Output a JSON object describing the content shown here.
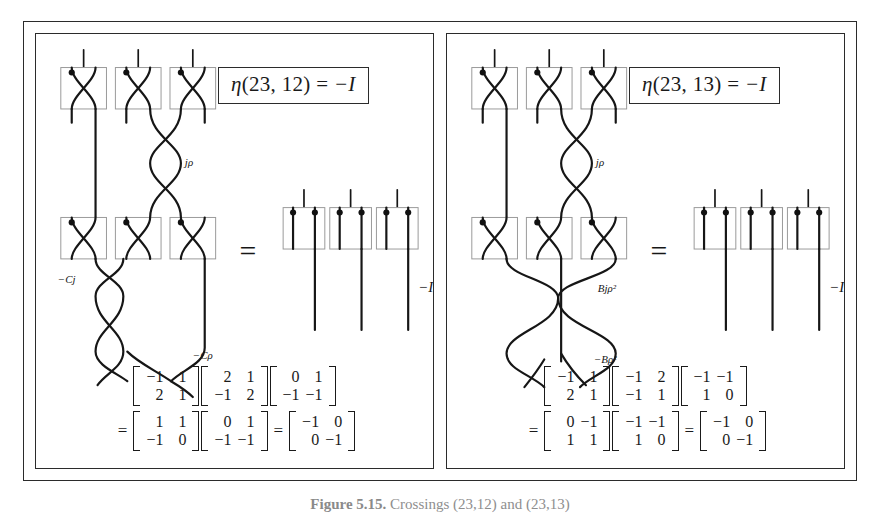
{
  "figure": {
    "caption_label": "Figure 5.15.",
    "caption_text": "Crossings (23,12) and (23,13)"
  },
  "panels": [
    {
      "id": "left",
      "equation_eta": "η(23, 12) = −I",
      "eta_symbol": "η",
      "eta_args": "(23, 12)",
      "eta_equals": "=",
      "eta_value": "−I",
      "identity_label": "−I",
      "equals_sign": "=",
      "crossing_labels": [
        "jρ",
        "−Cj",
        "−Cρ"
      ],
      "generator_boxes_top": 3,
      "generator_boxes_bottom": 3,
      "identity_boxes": 3,
      "matrix_line_1": [
        {
          "rows": [
            [
              "−1",
              "1"
            ],
            [
              "2",
              "1"
            ]
          ]
        },
        {
          "rows": [
            [
              "2",
              "1"
            ],
            [
              "−1",
              "2"
            ]
          ]
        },
        {
          "rows": [
            [
              "0",
              "1"
            ],
            [
              "−1",
              "−1"
            ]
          ]
        }
      ],
      "matrix_line_2_prefix": "=",
      "matrix_line_2": [
        {
          "rows": [
            [
              "1",
              "1"
            ],
            [
              "−1",
              "0"
            ]
          ]
        },
        {
          "rows": [
            [
              "0",
              "1"
            ],
            [
              "−1",
              "−1"
            ]
          ]
        }
      ],
      "matrix_line_2_equals": "=",
      "matrix_result": {
        "rows": [
          [
            "−1",
            "0"
          ],
          [
            "0",
            "−1"
          ]
        ]
      }
    },
    {
      "id": "right",
      "equation_eta": "η(23, 13) = −I",
      "eta_symbol": "η",
      "eta_args": "(23, 13)",
      "eta_equals": "=",
      "eta_value": "−I",
      "identity_label": "−I",
      "equals_sign": "=",
      "crossing_labels": [
        "jρ",
        "Bjρ²",
        "−Bρ²"
      ],
      "generator_boxes_top": 3,
      "generator_boxes_bottom": 3,
      "identity_boxes": 3,
      "matrix_line_1": [
        {
          "rows": [
            [
              "−1",
              "1"
            ],
            [
              "2",
              "1"
            ]
          ]
        },
        {
          "rows": [
            [
              "−1",
              "2"
            ],
            [
              "−1",
              "1"
            ]
          ]
        },
        {
          "rows": [
            [
              "−1",
              "−1"
            ],
            [
              "1",
              "0"
            ]
          ]
        }
      ],
      "matrix_line_2_prefix": "=",
      "matrix_line_2": [
        {
          "rows": [
            [
              "0",
              "−1"
            ],
            [
              "1",
              "1"
            ]
          ]
        },
        {
          "rows": [
            [
              "−1",
              "−1"
            ],
            [
              "1",
              "0"
            ]
          ]
        }
      ],
      "matrix_line_2_equals": "=",
      "matrix_result": {
        "rows": [
          [
            "−1",
            "0"
          ],
          [
            "0",
            "−1"
          ]
        ]
      }
    }
  ],
  "colors": {
    "frame": "#2b2b2b",
    "strand": "#161616",
    "gbox_stroke": "#9a9a9a",
    "caption": "#8e8e8e"
  }
}
